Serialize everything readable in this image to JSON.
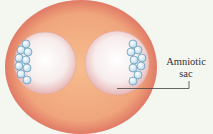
{
  "diagram": {
    "labels": {
      "amniotic_sac_line1": "Amniotic",
      "amniotic_sac_line2": "sac"
    },
    "colors": {
      "background": "#f4f6f0",
      "outer_sphere": "#f0a57c",
      "outer_sphere_edge": "#e07a66",
      "amniotic_sac": "#f7e3e2",
      "cells": "#cfe5f2",
      "cell_outline": "#5f97b6",
      "leader_line": "#444444"
    },
    "structures": [
      {
        "name": "outer-membrane",
        "shape": "circle"
      },
      {
        "name": "left-amniotic-sac",
        "shape": "circle"
      },
      {
        "name": "right-amniotic-sac",
        "shape": "circle"
      },
      {
        "name": "left-embryo-cell-cluster",
        "shape": "cluster"
      },
      {
        "name": "right-embryo-cell-cluster",
        "shape": "cluster"
      }
    ]
  }
}
